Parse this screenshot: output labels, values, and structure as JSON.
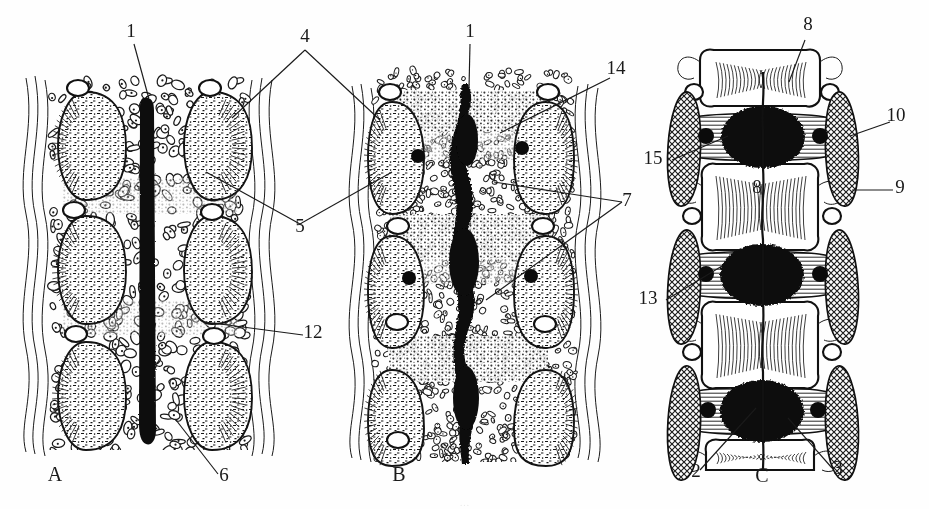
{
  "figure": {
    "panels": [
      {
        "id": "A",
        "label": "A",
        "name": "panel-a-early-stage",
        "description": "Early stage: continuous straight notochord flanked by mesenchymal sclerotome condensations",
        "notochord_form": "uniform straight rod"
      },
      {
        "id": "B",
        "label": "B",
        "name": "panel-b-intermediate-stage",
        "description": "Intermediate stage: segmented notochord with nucleus pulposus expansions at disc levels",
        "notochord_form": "beaded / segmentally expanded"
      },
      {
        "id": "C",
        "label": "C",
        "name": "panel-c-definitive-stage",
        "description": "Definitive stage: chondrified vertebral bodies with black nucleus pulposus in intervertebral discs",
        "notochord_form": "restricted to nucleus pulposus"
      }
    ],
    "callouts": [
      {
        "key": "1a",
        "text": "1",
        "panel": "A",
        "x": 131,
        "y": 37,
        "target_x": 149,
        "target_y": 99,
        "name": "callout-1-panel-a"
      },
      {
        "key": "1b",
        "text": "1",
        "panel": "B",
        "x": 470,
        "y": 37,
        "target_x": 470,
        "target_y": 87,
        "name": "callout-1-panel-b"
      },
      {
        "key": "4",
        "text": "4",
        "panel": "AB",
        "x": 305,
        "y": 42,
        "name": "callout-4-bracket"
      },
      {
        "key": "5",
        "text": "5",
        "panel": "AB",
        "x": 300,
        "y": 232,
        "name": "callout-5-bracket"
      },
      {
        "key": "6",
        "text": "6",
        "panel": "A",
        "x": 224,
        "y": 481,
        "target_x": 176,
        "target_y": 421,
        "name": "callout-6-panel-a"
      },
      {
        "key": "12",
        "text": "12",
        "panel": "B",
        "x": 313,
        "y": 338,
        "target_x": 205,
        "target_y": 323,
        "name": "callout-12-panel-b"
      },
      {
        "key": "14",
        "text": "14",
        "panel": "B",
        "x": 616,
        "y": 74,
        "target_x": 500,
        "target_y": 132,
        "name": "callout-14-panel-b"
      },
      {
        "key": "7",
        "text": "7",
        "panel": "B",
        "x": 627,
        "y": 206,
        "name": "callout-7-bracket"
      },
      {
        "key": "8t",
        "text": "8",
        "panel": "C",
        "x": 808,
        "y": 30,
        "target_x": 790,
        "target_y": 80,
        "name": "callout-8-top-panel-c"
      },
      {
        "key": "8m",
        "text": "8",
        "panel": "C",
        "x": 757,
        "y": 193,
        "name": "callout-8-inner-panel-c"
      },
      {
        "key": "10",
        "text": "10",
        "panel": "C",
        "x": 896,
        "y": 121,
        "target_x": 858,
        "target_y": 134,
        "name": "callout-10-panel-c"
      },
      {
        "key": "9",
        "text": "9",
        "panel": "C",
        "x": 900,
        "y": 193,
        "target_x": 860,
        "target_y": 190,
        "name": "callout-9-panel-c"
      },
      {
        "key": "15",
        "text": "15",
        "panel": "C",
        "x": 653,
        "y": 164,
        "target_x": 726,
        "target_y": 137,
        "name": "callout-15-panel-c"
      },
      {
        "key": "13",
        "text": "13",
        "panel": "C",
        "x": 648,
        "y": 304,
        "target_x": 718,
        "target_y": 268,
        "name": "callout-13-panel-c"
      },
      {
        "key": "2",
        "text": "2",
        "panel": "C",
        "x": 696,
        "y": 477,
        "target_x": 753,
        "target_y": 410,
        "name": "callout-2-panel-c"
      },
      {
        "key": "3",
        "text": "3",
        "panel": "C",
        "x": 838,
        "y": 474,
        "target_x": 790,
        "target_y": 420,
        "name": "callout-3-panel-c"
      }
    ],
    "panel_labels": [
      {
        "text": "A",
        "x": 55,
        "y": 481,
        "name": "panel-label-a"
      },
      {
        "text": "B",
        "x": 399,
        "y": 481,
        "name": "panel-label-b"
      },
      {
        "text": "C",
        "x": 762,
        "y": 482,
        "name": "panel-label-c"
      }
    ],
    "colors": {
      "ink": "#1a1a1a",
      "fill_black": "#0b0b0b",
      "paper": "#fefefe"
    },
    "caption_partial": "…"
  }
}
